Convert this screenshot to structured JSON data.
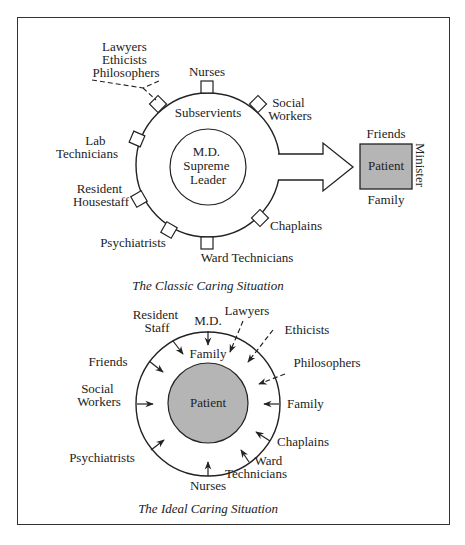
{
  "classic": {
    "caption": "The Classic Caring Situation",
    "center": [
      "M.D.",
      "Supreme",
      "Leader"
    ],
    "ring_label": "Subservients",
    "outer_labels": {
      "lawyers_group": [
        "Lawyers",
        "Ethicists",
        "Philosophers"
      ],
      "nurses": "Nurses",
      "social_workers": [
        "Social",
        "Workers"
      ],
      "lab_technicians": [
        "Lab",
        "Technicians"
      ],
      "resident_housestaff": [
        "Resident",
        "Housestaff"
      ],
      "psychiatrists": "Psychiatrists",
      "ward_technicians": "Ward Technicians",
      "chaplains": "Chaplains"
    },
    "patient_box": {
      "label": "Patient",
      "top": "Friends",
      "bottom": "Family",
      "side": "Minister",
      "fill": "#b5b5b5"
    }
  },
  "ideal": {
    "caption": "The Ideal Caring Situation",
    "center": "Patient",
    "center_fill": "#b5b5b5",
    "inner_label": "Family",
    "outer_labels": {
      "resident_staff": [
        "Resident",
        "Staff"
      ],
      "md": "M.D.",
      "lawyers": "Lawyers",
      "ethicists": "Ethicists",
      "philosophers": "Philosophers",
      "friends": "Friends",
      "social_workers": [
        "Social",
        "Workers"
      ],
      "family": "Family",
      "chaplains": "Chaplains",
      "psychiatrists": "Psychiatrists",
      "ward_technicians": [
        "Ward",
        "Technicians"
      ],
      "nurses": "Nurses"
    }
  }
}
